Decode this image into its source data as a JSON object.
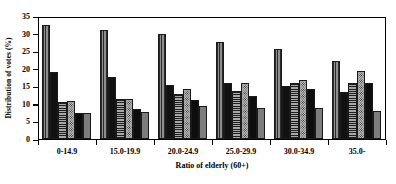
{
  "chart_data": {
    "type": "bar",
    "title": "",
    "xlabel": "Ratio of elderly (60+)",
    "ylabel": "Distribution of votes (%)",
    "categories": [
      "0-14.9",
      "15.0-19.9",
      "20.0-24.9",
      "25.0-29.9",
      "30.0-34.9",
      "35.0-"
    ],
    "ylim": [
      0,
      35
    ],
    "yticks": [
      0,
      5,
      10,
      15,
      20,
      25,
      30,
      35
    ],
    "ytick_labels": [
      "0",
      "5",
      "10",
      "15",
      "20",
      "25",
      "30",
      "35"
    ],
    "grid": false,
    "legend": "none",
    "series": [
      {
        "name": "Series 1",
        "pattern": "vertical-stripe",
        "color": "#6f6f6f",
        "values": [
          32.5,
          31.0,
          30.0,
          27.5,
          25.5,
          22.3
        ]
      },
      {
        "name": "Series 2",
        "pattern": "solid-black",
        "color": "#111111",
        "values": [
          19.2,
          17.6,
          15.5,
          16.0,
          15.0,
          13.5
        ]
      },
      {
        "name": "Series 3",
        "pattern": "horizontal-stripe",
        "color": "#6d6d6d",
        "values": [
          10.5,
          11.3,
          12.8,
          13.8,
          15.8,
          16.0
        ]
      },
      {
        "name": "Series 4",
        "pattern": "dotted",
        "color": "#b9b9b9",
        "values": [
          10.8,
          11.5,
          14.3,
          16.0,
          16.8,
          19.3
        ]
      },
      {
        "name": "Series 5",
        "pattern": "solid-black",
        "color": "#0d0d0d",
        "values": [
          7.4,
          8.5,
          11.0,
          12.3,
          14.2,
          16.0
        ]
      },
      {
        "name": "Series 6",
        "pattern": "solid-gray",
        "color": "#7d7d7d",
        "values": [
          7.4,
          7.8,
          9.3,
          8.8,
          8.8,
          8.0
        ]
      }
    ]
  },
  "axes": {
    "y_title": "Distribution of votes (%)",
    "x_title": "Ratio of elderly (60+)"
  }
}
